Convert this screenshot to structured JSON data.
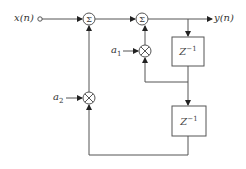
{
  "diagram": {
    "type": "signal-flow block diagram (second-order IIR filter)",
    "input_label": "x(n)",
    "output_label": "y(n)",
    "coefficients": [
      "a1",
      "a2"
    ],
    "coefficient_labels": {
      "a1": "a",
      "a1_sub": "1",
      "a2": "a",
      "a2_sub": "2"
    },
    "adders": [
      {
        "id": "sum1",
        "symbol": "Σ"
      },
      {
        "id": "sum2",
        "symbol": "Σ"
      }
    ],
    "multipliers": [
      {
        "id": "mult_a1",
        "symbol": "⊗",
        "coefficient": "a1"
      },
      {
        "id": "mult_a2",
        "symbol": "⊗",
        "coefficient": "a2"
      }
    ],
    "delays": [
      {
        "id": "delay1",
        "label": "Z",
        "exponent": "−1"
      },
      {
        "id": "delay2",
        "label": "Z",
        "exponent": "−1"
      }
    ],
    "line_color": "#555555",
    "text_color": "#333333"
  }
}
